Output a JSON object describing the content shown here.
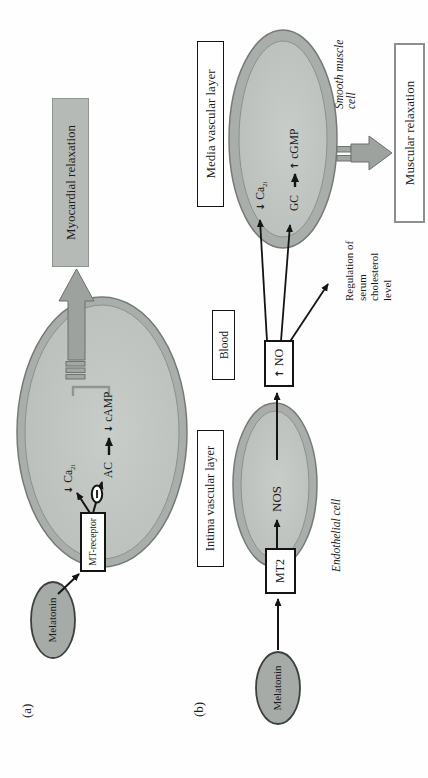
{
  "figure": {
    "panel_a": {
      "label": "(a)",
      "melatonin_label": "Melatonin",
      "receptor_label": "MT-receptor",
      "ca_arrow": "↓",
      "ca_base": "Ca",
      "ca_sub": "2i",
      "ac_label": "AC",
      "camp_arrow": "↓",
      "camp_label": "cAMP",
      "outcome_label": "Myocardial relaxation"
    },
    "panel_b": {
      "label": "(b)",
      "melatonin_label": "Melatonin",
      "receptor_label": "MT2",
      "nos_label": "NOS",
      "no_arrow": "↑",
      "no_label": "NO",
      "blood_label": "Blood",
      "intima_label": "Intima vascular layer",
      "media_label": "Media vascular layer",
      "endothelial_label": "Endothelial cell",
      "smooth_muscle_line1": "Smooth muscle",
      "smooth_muscle_line2": "cell",
      "ca_arrow": "↓",
      "ca_base": "Ca",
      "ca_sub": "2i",
      "gc_label": "GC",
      "cgmp_arrow": "↑",
      "cgmp_label": "cGMP",
      "cholesterol_lines": [
        "Regulation of",
        "serum",
        "cholesterol",
        "level"
      ],
      "outcome_label": "Muscular relaxation"
    },
    "colors": {
      "cell_membrane": "#a9aeab",
      "cell_fill_center": "#c6cbc7",
      "cell_fill_edge": "#b2b7b3",
      "melatonin_fill": "#a6aba8",
      "gray_arrow": "#9da29f",
      "gray_arrow_edge": "#6a706c",
      "outcome_bar_fill": "#b5bab7",
      "line_black": "#141414"
    }
  }
}
